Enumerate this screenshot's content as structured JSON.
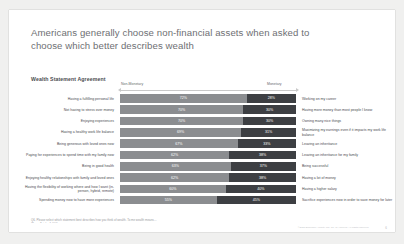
{
  "slide": {
    "title": "Americans generally choose non-financial assets when asked to choose which better describes wealth",
    "section_label": "Wealth Statement Agreement",
    "footnote_line1": "Q6. Please select which statement best describes how you think of wealth. To me wealth means…",
    "footnote_line2": "(Base: Total = 1,000)",
    "credit": "©2023 Empower Annuity Ins. Co. of America. All rights reserved.",
    "page_number": "6"
  },
  "chart_data": {
    "type": "bar",
    "title": "Wealth Statement Agreement",
    "orientation": "horizontal",
    "stacked": true,
    "xlabel": "",
    "ylabel": "",
    "xlim": [
      0,
      100
    ],
    "grid": false,
    "legend_position": "top",
    "legend": [
      {
        "name": "Non-Monetary",
        "color": "#8b8d90"
      },
      {
        "name": "Monetary",
        "color": "#3d3f43"
      }
    ],
    "categories": [
      "Having a fulfilling personal life",
      "Not having to stress over money",
      "Enjoying experiences",
      "Having a healthy work life balance",
      "Being generous with loved ones now",
      "Paying for experiences to spend time with my family now",
      "Being in good health",
      "Enjoying healthy relationships with family and loved ones",
      "Having the flexibility of working where and how I want (in-person, hybrid, remote)",
      "Spending money now to have more experiences"
    ],
    "categories_right": [
      "Working on my career",
      "Having more money than most people I know",
      "Owning many nice things",
      "Maximizing my earnings even if it impacts my work life balance",
      "Leaving an inheritance",
      "Leaving an inheritance for my family",
      "Being successful",
      "Having a lot of money",
      "Having a higher salary",
      "Sacrifice experiences now in order to save money for later"
    ],
    "series": [
      {
        "name": "Non-Monetary",
        "values": [
          72,
          70,
          70,
          69,
          67,
          62,
          63,
          62,
          60,
          55
        ]
      },
      {
        "name": "Monetary",
        "values": [
          28,
          30,
          30,
          31,
          33,
          38,
          37,
          38,
          40,
          45
        ]
      }
    ],
    "value_suffix": "%"
  }
}
